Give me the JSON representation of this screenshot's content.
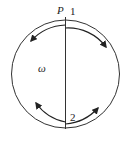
{
  "diagram": {
    "labels": {
      "point": "P",
      "top_num": "1",
      "bottom_num": "2",
      "omega": "ω"
    },
    "colors": {
      "stroke": "#333333",
      "background": "#ffffff"
    }
  }
}
